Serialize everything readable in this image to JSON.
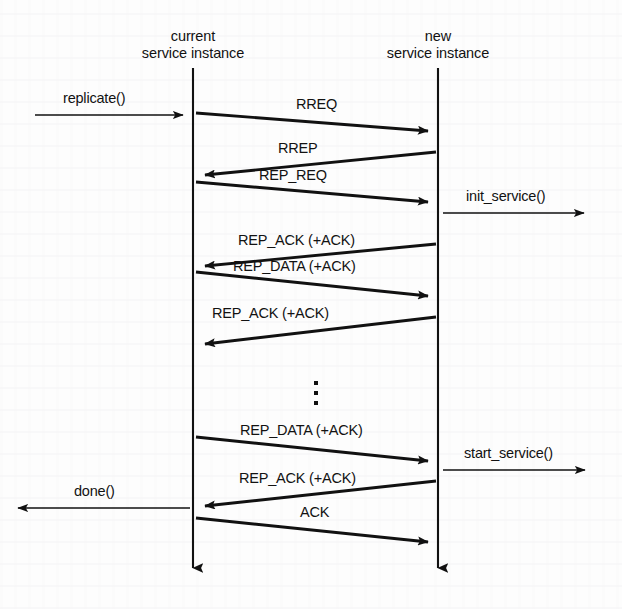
{
  "diagram": {
    "background_color": "#fdfdfd",
    "ink_color": "#111111",
    "lifelines": [
      {
        "id": "current",
        "name_line1": "current",
        "name_line2": "service instance",
        "x": 193,
        "top": 68,
        "bottom": 578
      },
      {
        "id": "new",
        "name_line1": "new",
        "name_line2": "service instance",
        "x": 438,
        "top": 68,
        "bottom": 578
      }
    ],
    "external_calls": [
      {
        "id": "replicate",
        "label": "replicate()",
        "direction": "right",
        "x1": 35,
        "y1": 115,
        "x2": 189,
        "y2": 115,
        "label_x": 63,
        "label_y": 96
      },
      {
        "id": "init_service",
        "label": "init_service()",
        "direction": "right",
        "x1": 443,
        "y1": 213,
        "x2": 590,
        "y2": 213,
        "label_x": 466,
        "label_y": 194
      },
      {
        "id": "start_service",
        "label": "start_service()",
        "direction": "right",
        "x1": 443,
        "y1": 470,
        "x2": 591,
        "y2": 470,
        "label_x": 464,
        "label_y": 451
      },
      {
        "id": "done",
        "label": "done()",
        "direction": "left",
        "x1": 190,
        "y1": 508,
        "x2": 12,
        "y2": 508,
        "label_x": 74,
        "label_y": 489
      }
    ],
    "messages": [
      {
        "id": "rreq",
        "label": "RREQ",
        "direction": "right",
        "x1": 196,
        "y1": 113,
        "x2": 436,
        "y2": 132,
        "label_x": 296,
        "label_y": 99
      },
      {
        "id": "rrep",
        "label": "RREP",
        "direction": "left",
        "x1": 436,
        "y1": 152,
        "x2": 197,
        "y2": 176,
        "label_x": 278,
        "label_y": 143
      },
      {
        "id": "rep_req",
        "label": "REP_REQ",
        "direction": "right",
        "x1": 196,
        "y1": 182,
        "x2": 436,
        "y2": 203,
        "label_x": 259,
        "label_y": 170
      },
      {
        "id": "rep_ack_1",
        "label": "REP_ACK (+ACK)",
        "direction": "left",
        "x1": 436,
        "y1": 244,
        "x2": 197,
        "y2": 267,
        "label_x": 238,
        "label_y": 235
      },
      {
        "id": "rep_data_1",
        "label": "REP_DATA (+ACK)",
        "direction": "right",
        "x1": 196,
        "y1": 272,
        "x2": 436,
        "y2": 297,
        "label_x": 233,
        "label_y": 260
      },
      {
        "id": "rep_ack_2",
        "label": "REP_ACK (+ACK)",
        "direction": "left",
        "x1": 436,
        "y1": 317,
        "x2": 197,
        "y2": 345,
        "label_x": 212,
        "label_y": 308
      },
      {
        "id": "rep_data_2",
        "label": "REP_DATA (+ACK)",
        "direction": "right",
        "x1": 196,
        "y1": 437,
        "x2": 436,
        "y2": 462,
        "label_x": 240,
        "label_y": 425
      },
      {
        "id": "rep_ack_3",
        "label": "REP_ACK (+ACK)",
        "direction": "left",
        "x1": 436,
        "y1": 481,
        "x2": 197,
        "y2": 507,
        "label_x": 239,
        "label_y": 473
      },
      {
        "id": "ack_final",
        "label": "ACK",
        "direction": "right",
        "x1": 196,
        "y1": 518,
        "x2": 436,
        "y2": 543,
        "label_x": 300,
        "label_y": 507
      }
    ],
    "ellipsis": {
      "id": "continuation-ellipsis",
      "symbol": "vertical-ellipsis",
      "x": 316,
      "dots": [
        383,
        393,
        403
      ],
      "dot_size": 4
    }
  }
}
